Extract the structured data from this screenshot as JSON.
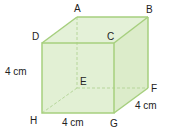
{
  "figure": {
    "type": "cube",
    "colors": {
      "face": "#e2f0d4",
      "face_side": "#d8eac6",
      "edge": "#a6cf7e",
      "hidden": "#b9d8a0",
      "label": "#222222"
    },
    "vertices": {
      "A": {
        "label": "A",
        "x": 77,
        "y": 17
      },
      "B": {
        "label": "B",
        "x": 148,
        "y": 17
      },
      "C": {
        "label": "C",
        "x": 114,
        "y": 43
      },
      "D": {
        "label": "D",
        "x": 42,
        "y": 43
      },
      "E": {
        "label": "E",
        "x": 77,
        "y": 88
      },
      "F": {
        "label": "F",
        "x": 148,
        "y": 88
      },
      "G": {
        "label": "G",
        "x": 114,
        "y": 113
      },
      "H": {
        "label": "H",
        "x": 42,
        "y": 113
      }
    },
    "measurements": {
      "height": "4 cm",
      "width": "4 cm",
      "depth": "4 cm"
    }
  }
}
